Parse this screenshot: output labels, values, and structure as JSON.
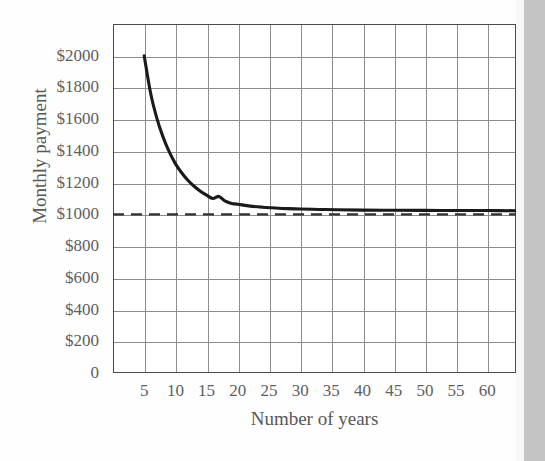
{
  "figure": {
    "kind": "scanned-textbook-figure",
    "background_color": "#fefefe",
    "frame_color": "#4a4a4a",
    "grid_color": "#8d8d8d",
    "text_color": "#5e5e5e",
    "curve_color": "#1a1a1a",
    "asymptote_color": "#333333",
    "scan_strip_color": "#b9b9b9"
  },
  "chart_data": {
    "type": "line",
    "title": "",
    "subtitle": "",
    "xlabel": "Number of years",
    "ylabel": "Monthly payment",
    "grid": true,
    "legend": "none",
    "xlim": [
      0,
      64.6
    ],
    "ylim": [
      0,
      2200
    ],
    "xticks": [
      5,
      10,
      15,
      20,
      25,
      30,
      35,
      40,
      45,
      50,
      55,
      60
    ],
    "xtick_labels": [
      "5",
      "10",
      "15",
      "20",
      "25",
      "30",
      "35",
      "40",
      "45",
      "50",
      "55",
      "60"
    ],
    "yticks": [
      0,
      200,
      400,
      600,
      800,
      1000,
      1200,
      1400,
      1600,
      1800,
      2000
    ],
    "ytick_labels": [
      "0",
      "$200",
      "$400",
      "$600",
      "$800",
      "$1000",
      "$1200",
      "$1400",
      "$1600",
      "$1800",
      "$2000"
    ],
    "series": [
      {
        "name": "Monthly payment",
        "style": "solid",
        "color": "#1a1a1a",
        "x": [
          5,
          6,
          7,
          8,
          9,
          10,
          11,
          12,
          13,
          14,
          15,
          16,
          17,
          18,
          19,
          20,
          22,
          24,
          26,
          28,
          30,
          33,
          36,
          40,
          45,
          50,
          55,
          60,
          64.6
        ],
        "y": [
          2000,
          1770,
          1610,
          1490,
          1395,
          1320,
          1262,
          1215,
          1177,
          1146,
          1121,
          1100,
          1113,
          1083,
          1069,
          1064,
          1052,
          1045,
          1040,
          1036,
          1034,
          1031,
          1029,
          1027,
          1026,
          1025,
          1024,
          1024,
          1023
        ]
      },
      {
        "name": "Asymptote",
        "style": "dashed",
        "color": "#333333",
        "value": 1000,
        "x": [
          0,
          64.6
        ],
        "y": [
          1000,
          1000
        ]
      }
    ],
    "annotations": [
      {
        "text": "horizontal asymptote at $1000",
        "y": 1000
      }
    ]
  },
  "axes": {
    "y_title": "Monthly payment",
    "x_title": "Number of years",
    "zero_label": "0"
  }
}
